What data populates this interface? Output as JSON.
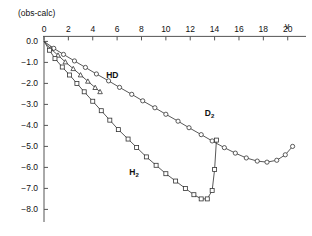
{
  "chart_data": {
    "type": "line",
    "title": "",
    "xlabel": "v",
    "ylabel": "(obs-calc)",
    "xlim": [
      0,
      21.5
    ],
    "ylim": [
      -8.6,
      0.4
    ],
    "grid": false,
    "legend": "inline-annotations",
    "xticks": [
      0,
      2,
      4,
      6,
      8,
      10,
      12,
      14,
      16,
      18,
      20
    ],
    "xticklabels": [
      "0",
      "2",
      "4",
      "6",
      "8",
      "10",
      "12",
      "14",
      "16",
      "18",
      "20"
    ],
    "yticks": [
      0.0,
      -1.0,
      -2.0,
      -3.0,
      -4.0,
      -5.0,
      -6.0,
      -7.0,
      -8.0
    ],
    "yticklabels": [
      "0.0",
      "-1.0",
      "-2.0",
      "-3.0",
      "-4.0",
      "-5.0",
      "-6.0",
      "-7.0",
      "-8.0"
    ],
    "series": [
      {
        "name": "D2",
        "label": "D",
        "label_sub": "2",
        "marker": "circle",
        "label_x": 13.2,
        "label_y": -3.55,
        "x": [
          0,
          0.8,
          1.6,
          2.5,
          3.4,
          4.3,
          5.3,
          6.2,
          7.2,
          8.1,
          9.1,
          10.0,
          11.0,
          11.9,
          12.9,
          13.8,
          14.8,
          15.7,
          16.6,
          17.5,
          18.3,
          19.1,
          19.8,
          20.4
        ],
        "y": [
          0.0,
          -0.33,
          -0.62,
          -0.93,
          -1.24,
          -1.55,
          -1.88,
          -2.19,
          -2.52,
          -2.83,
          -3.16,
          -3.47,
          -3.8,
          -4.11,
          -4.44,
          -4.74,
          -5.06,
          -5.32,
          -5.55,
          -5.7,
          -5.75,
          -5.66,
          -5.4,
          -5.0
        ]
      },
      {
        "name": "HD",
        "label": "HD",
        "label_sub": "",
        "marker": "triangle",
        "label_x": 5.1,
        "label_y": -1.72,
        "x": [
          0,
          0.55,
          1.15,
          1.75,
          2.4,
          3.0,
          3.6,
          4.2,
          4.6
        ],
        "y": [
          0.0,
          -0.35,
          -0.66,
          -0.98,
          -1.3,
          -1.6,
          -1.9,
          -2.2,
          -2.4
        ]
      },
      {
        "name": "H2",
        "label": "H",
        "label_sub": "2",
        "marker": "square",
        "label_x": 7.0,
        "label_y": -6.35,
        "x": [
          0,
          0.45,
          0.9,
          1.5,
          2.1,
          2.7,
          3.3,
          4.0,
          4.7,
          5.4,
          6.1,
          6.9,
          7.6,
          8.4,
          9.2,
          10.0,
          10.8,
          11.6,
          12.3,
          12.9,
          13.4,
          13.8,
          14.0,
          14.15
        ],
        "y": [
          0.0,
          -0.42,
          -0.82,
          -1.22,
          -1.6,
          -2.0,
          -2.4,
          -2.85,
          -3.3,
          -3.75,
          -4.2,
          -4.65,
          -5.05,
          -5.5,
          -5.9,
          -6.3,
          -6.65,
          -7.0,
          -7.3,
          -7.5,
          -7.5,
          -7.1,
          -6.1,
          -4.7
        ]
      }
    ]
  },
  "colors": {
    "axis": "#555555",
    "line": "#3a3a3a",
    "marker_fill": "#ffffff",
    "marker_stroke": "#333333",
    "background": "#ffffff",
    "text": "#111111"
  },
  "axis_titles": {
    "y_title": "(obs-calc)",
    "x_title": "v"
  }
}
